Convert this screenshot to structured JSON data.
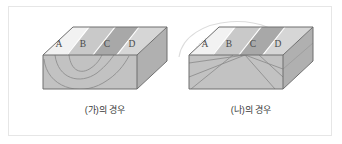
{
  "figure": {
    "title": "",
    "border_color": "#e6e6e6",
    "background": "#ffffff"
  },
  "colors": {
    "band_a": "#f2f2f2",
    "band_b": "#c9c9c9",
    "band_c": "#a8a8a8",
    "band_d": "#d6d6d6",
    "front_face": "#c2c2c2",
    "side_face": "#b0b0b0",
    "outline": "#6e6e6e",
    "fold_line": "#8f8f8f",
    "ghost_arc": "#dcdcdc",
    "caption_text": "#3a3a3a",
    "label_text": "#4a4a4a"
  },
  "panels": [
    {
      "id": "ga",
      "caption": "(가)의 경우",
      "fold_type": "syncline",
      "has_ghost_arch": false,
      "strata": [
        {
          "label": "A",
          "color": "#f2f2f2"
        },
        {
          "label": "B",
          "color": "#c9c9c9"
        },
        {
          "label": "C",
          "color": "#a8a8a8"
        },
        {
          "label": "D",
          "color": "#d6d6d6"
        }
      ]
    },
    {
      "id": "na",
      "caption": "(나)의 경우",
      "fold_type": "anticline",
      "has_ghost_arch": true,
      "strata": [
        {
          "label": "A",
          "color": "#f2f2f2"
        },
        {
          "label": "B",
          "color": "#c9c9c9"
        },
        {
          "label": "C",
          "color": "#a8a8a8"
        },
        {
          "label": "D",
          "color": "#d6d6d6"
        }
      ]
    }
  ]
}
